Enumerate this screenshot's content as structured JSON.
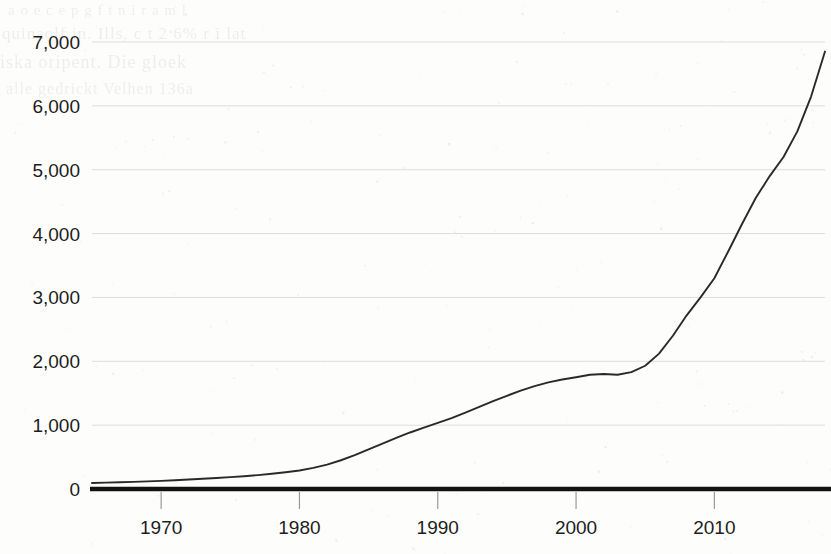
{
  "page": {
    "background_color": "#fdfdfc",
    "width": 831,
    "height": 554
  },
  "ghost_text": {
    "note": "faint bleed-through from reverse side of scanned page",
    "line1": "a  o   e   c      e        p  g   f   t   n     i   r  a   m   l",
    "line2": "quinaolf in. Ills,      c  t  2 6%        r    i  lat",
    "line3": "iska  oripent. Die  gloek",
    "line4": "alle  gedrickt  Velhen  136a"
  },
  "chart_data": {
    "type": "line",
    "title": "",
    "subtitle": "",
    "xlabel": "",
    "ylabel": "",
    "xlim": [
      1965,
      2018
    ],
    "ylim": [
      0,
      7400
    ],
    "grid": true,
    "legend": false,
    "legend_position": "none",
    "line_color": "#2a2a2a",
    "grid_color": "#ddddda",
    "axis_color": "#131313",
    "x_tick_labels": [
      "1970",
      "1980",
      "1990",
      "2000",
      "2010"
    ],
    "x_tick_values": [
      1970,
      1980,
      1990,
      2000,
      2010
    ],
    "y_tick_labels": [
      "0",
      "1,000",
      "2,000",
      "3,000",
      "4,000",
      "5,000",
      "6,000",
      "7,000"
    ],
    "y_tick_values": [
      0,
      1000,
      2000,
      3000,
      4000,
      5000,
      6000,
      7000
    ],
    "series": [
      {
        "name": "value",
        "x": [
          1965,
          1966,
          1967,
          1968,
          1969,
          1970,
          1971,
          1972,
          1973,
          1974,
          1975,
          1976,
          1977,
          1978,
          1979,
          1980,
          1981,
          1982,
          1983,
          1984,
          1985,
          1986,
          1987,
          1988,
          1989,
          1990,
          1991,
          1992,
          1993,
          1994,
          1995,
          1996,
          1997,
          1998,
          1999,
          2000,
          2001,
          2002,
          2003,
          2004,
          2005,
          2006,
          2007,
          2008,
          2009,
          2010,
          2011,
          2012,
          2013,
          2014,
          2015,
          2016,
          2017,
          2018
        ],
        "values": [
          95,
          100,
          105,
          112,
          120,
          128,
          138,
          148,
          160,
          172,
          186,
          200,
          218,
          238,
          262,
          290,
          330,
          382,
          450,
          530,
          620,
          710,
          800,
          885,
          960,
          1035,
          1110,
          1195,
          1285,
          1375,
          1460,
          1540,
          1610,
          1670,
          1715,
          1750,
          1790,
          1800,
          1790,
          1830,
          1930,
          2120,
          2400,
          2720,
          3000,
          3300,
          3720,
          4150,
          4560,
          4900,
          5200,
          5600,
          6150,
          6850
        ]
      }
    ],
    "annotations": []
  },
  "axes_geometry": {
    "plot_left": 92,
    "plot_right": 825,
    "plot_top": 42,
    "plot_bottom": 489
  }
}
